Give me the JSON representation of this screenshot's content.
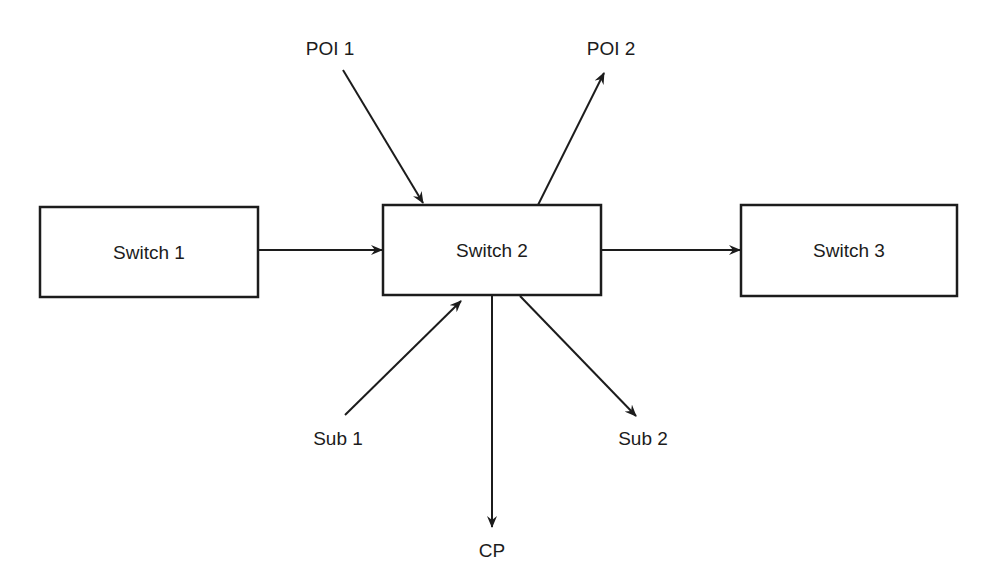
{
  "diagram": {
    "nodes": [
      {
        "id": "switch1",
        "label": "Switch 1",
        "x": 40,
        "y": 207,
        "w": 218,
        "h": 90
      },
      {
        "id": "switch2",
        "label": "Switch 2",
        "x": 383,
        "y": 205,
        "w": 218,
        "h": 90
      },
      {
        "id": "switch3",
        "label": "Switch 3",
        "x": 741,
        "y": 205,
        "w": 216,
        "h": 91
      }
    ],
    "endpoints": [
      {
        "id": "poi1",
        "label": "POI 1",
        "x": 330,
        "y": 55
      },
      {
        "id": "poi2",
        "label": "POI 2",
        "x": 611,
        "y": 55
      },
      {
        "id": "sub1",
        "label": "Sub 1",
        "x": 338,
        "y": 445
      },
      {
        "id": "sub2",
        "label": "Sub 2",
        "x": 643,
        "y": 445
      },
      {
        "id": "cp",
        "label": "CP",
        "x": 492,
        "y": 557
      }
    ],
    "edges": [
      {
        "from": "Switch 1",
        "to": "Switch 2"
      },
      {
        "from": "Switch 2",
        "to": "Switch 3"
      },
      {
        "from": "POI 1",
        "to": "Switch 2"
      },
      {
        "from": "Switch 2",
        "to": "POI 2"
      },
      {
        "from": "Sub 1",
        "to": "Switch 2"
      },
      {
        "from": "Switch 2",
        "to": "Sub 2"
      },
      {
        "from": "Switch 2",
        "to": "CP"
      }
    ],
    "colors": {
      "stroke": "#1c1c1c",
      "background": "#ffffff"
    }
  }
}
